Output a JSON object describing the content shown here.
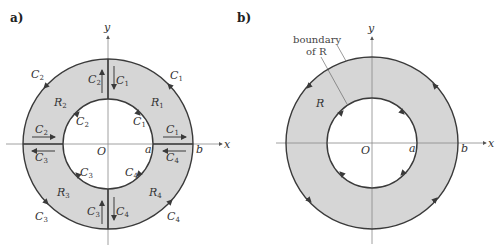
{
  "figure": {
    "colors": {
      "fill": "#d6d6d6",
      "stroke": "#3a3a3a",
      "axis": "#888888"
    },
    "panel_a": {
      "label": "a)",
      "axis_x": "x",
      "axis_y": "y",
      "origin": "O",
      "inner_radius_label": "a",
      "outer_radius_label": "b",
      "regions": [
        "R1",
        "R2",
        "R3",
        "R4"
      ],
      "curves": [
        "C1",
        "C2",
        "C3",
        "C4"
      ]
    },
    "panel_b": {
      "label": "b)",
      "axis_x": "x",
      "axis_y": "y",
      "origin": "O",
      "inner_radius_label": "a",
      "outer_radius_label": "b",
      "region": "R",
      "annotation_line1": "boundary",
      "annotation_line2": "of R"
    }
  }
}
